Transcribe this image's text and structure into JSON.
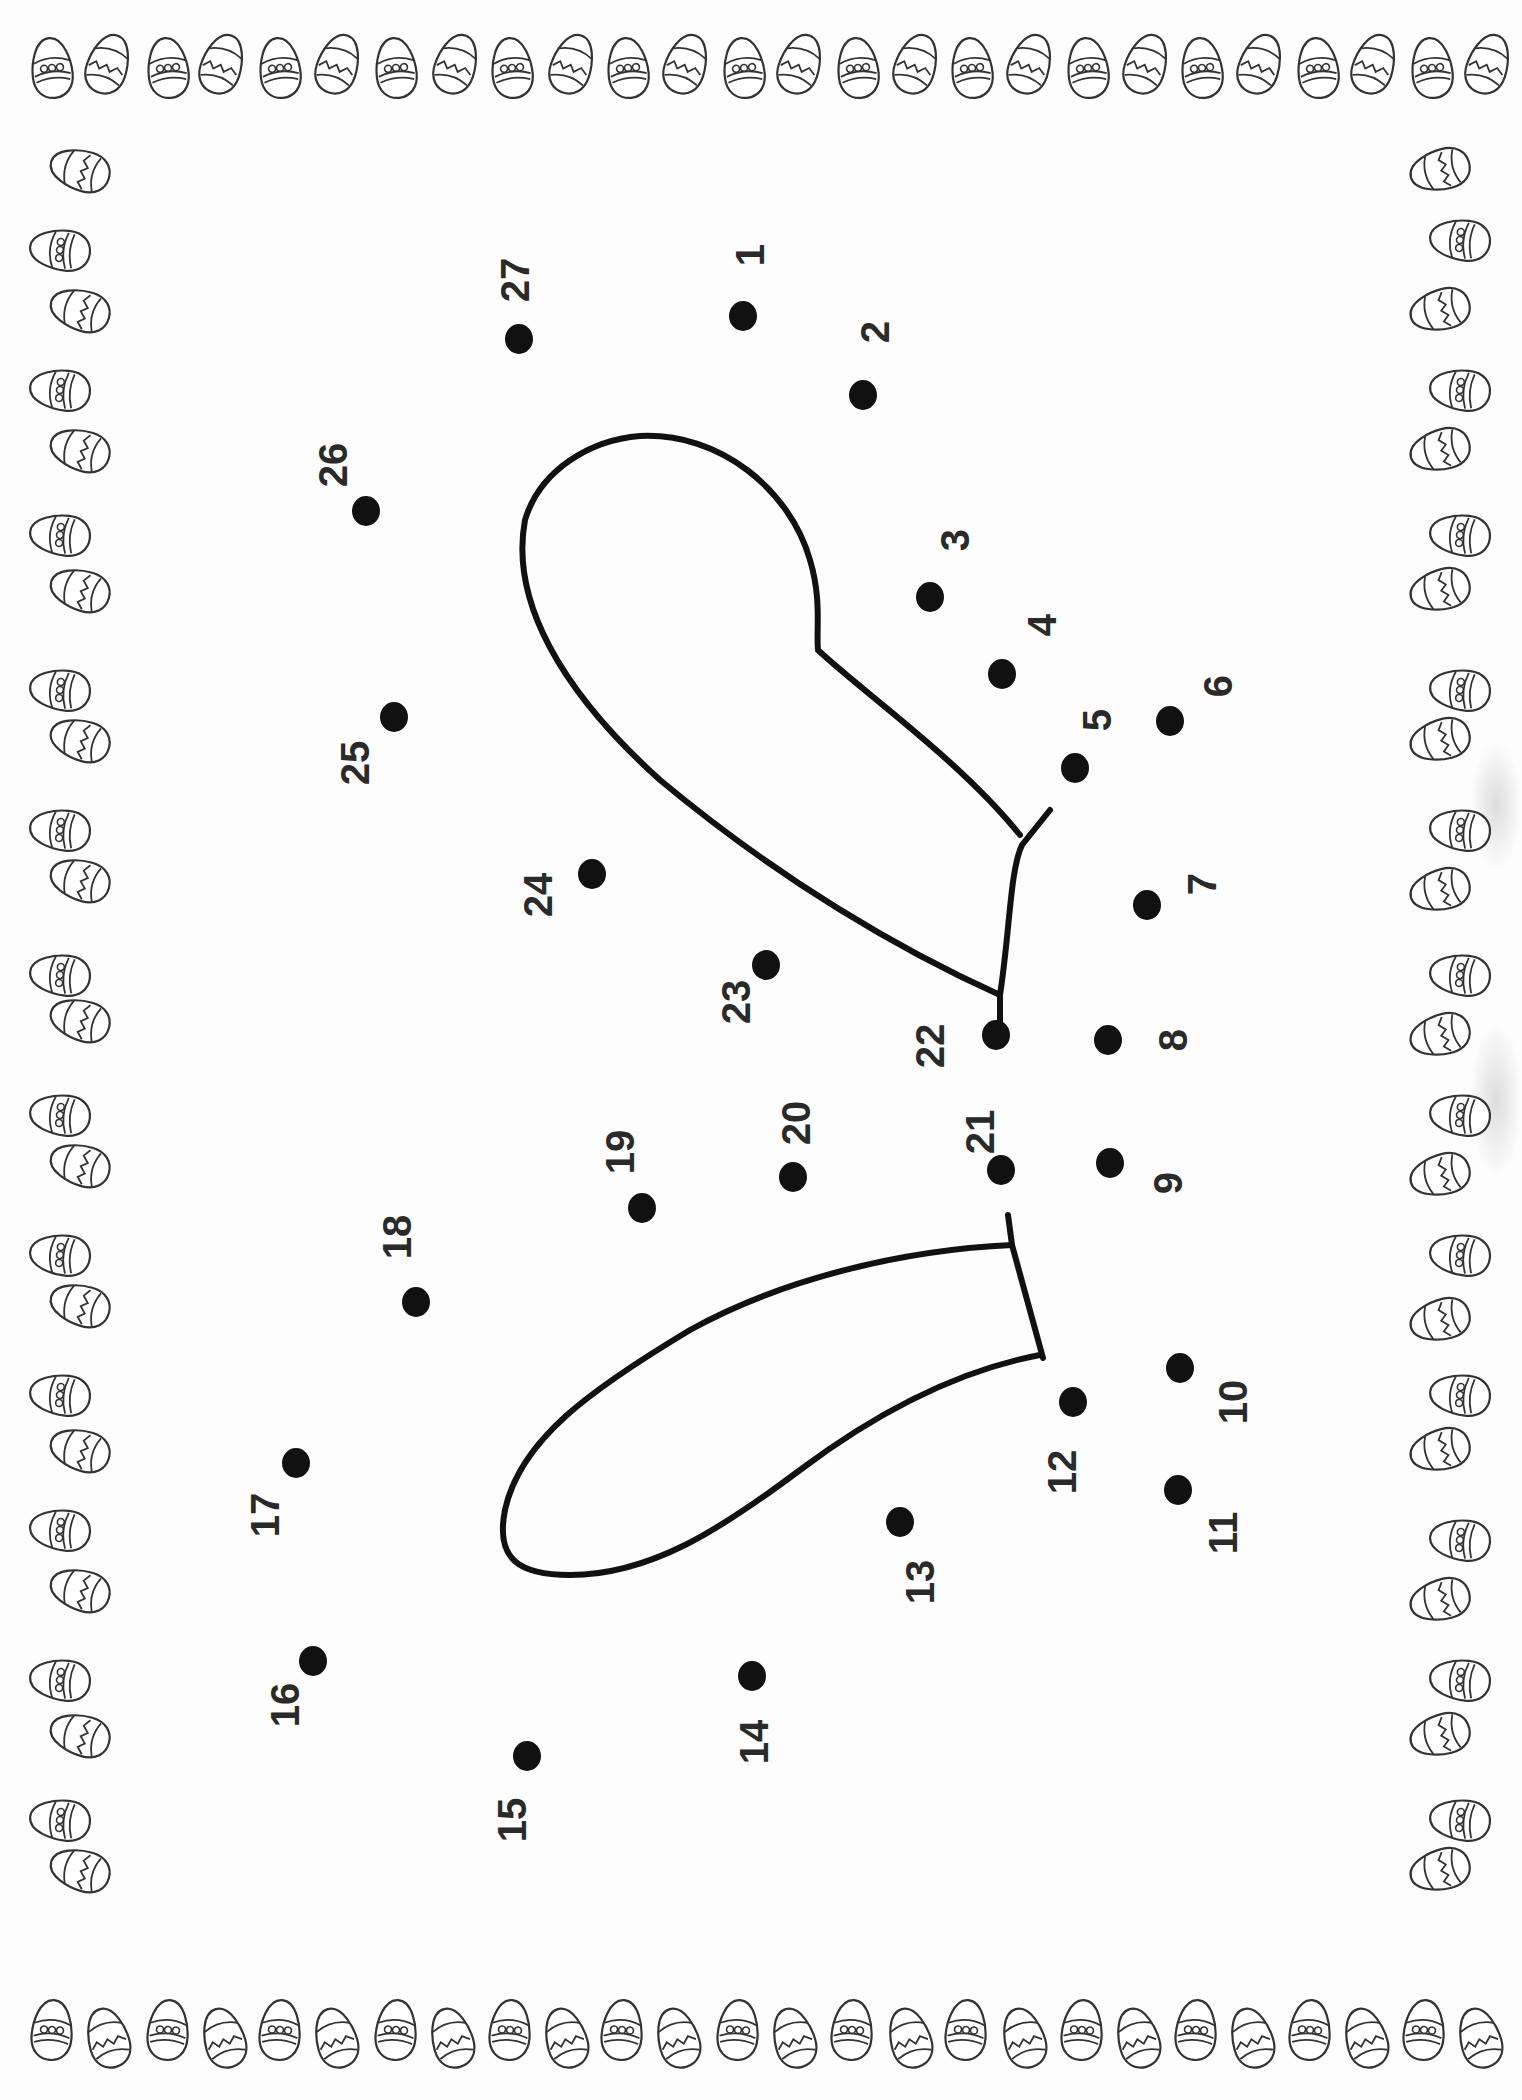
{
  "worksheet": {
    "type": "connect-the-dots",
    "subject": "bunny face with ears",
    "orientation": "rotated 90 degrees",
    "border": "easter-egg border",
    "ink_color": "#111111",
    "paper_color": "#fdfdfd"
  },
  "dots": [
    {
      "n": "1",
      "x": 743,
      "y": 316,
      "lx": 750,
      "ly": 255
    },
    {
      "n": "2",
      "x": 863,
      "y": 395,
      "lx": 875,
      "ly": 332
    },
    {
      "n": "3",
      "x": 930,
      "y": 597,
      "lx": 955,
      "ly": 540
    },
    {
      "n": "4",
      "x": 1002,
      "y": 674,
      "lx": 1042,
      "ly": 625
    },
    {
      "n": "5",
      "x": 1075,
      "y": 768,
      "lx": 1097,
      "ly": 720
    },
    {
      "n": "6",
      "x": 1170,
      "y": 721,
      "lx": 1218,
      "ly": 686
    },
    {
      "n": "7",
      "x": 1147,
      "y": 905,
      "lx": 1202,
      "ly": 884
    },
    {
      "n": "8",
      "x": 1108,
      "y": 1040,
      "lx": 1173,
      "ly": 1040
    },
    {
      "n": "9",
      "x": 1110,
      "y": 1163,
      "lx": 1168,
      "ly": 1183
    },
    {
      "n": "10",
      "x": 1180,
      "y": 1368,
      "lx": 1233,
      "ly": 1402
    },
    {
      "n": "11",
      "x": 1178,
      "y": 1490,
      "lx": 1223,
      "ly": 1533
    },
    {
      "n": "12",
      "x": 1073,
      "y": 1402,
      "lx": 1062,
      "ly": 1472
    },
    {
      "n": "13",
      "x": 900,
      "y": 1522,
      "lx": 920,
      "ly": 1582
    },
    {
      "n": "14",
      "x": 752,
      "y": 1676,
      "lx": 754,
      "ly": 1742
    },
    {
      "n": "15",
      "x": 527,
      "y": 1756,
      "lx": 512,
      "ly": 1820
    },
    {
      "n": "16",
      "x": 313,
      "y": 1661,
      "lx": 285,
      "ly": 1705
    },
    {
      "n": "17",
      "x": 296,
      "y": 1463,
      "lx": 265,
      "ly": 1515
    },
    {
      "n": "18",
      "x": 416,
      "y": 1302,
      "lx": 397,
      "ly": 1237
    },
    {
      "n": "19",
      "x": 642,
      "y": 1208,
      "lx": 620,
      "ly": 1152
    },
    {
      "n": "20",
      "x": 793,
      "y": 1177,
      "lx": 796,
      "ly": 1123
    },
    {
      "n": "21",
      "x": 1001,
      "y": 1170,
      "lx": 980,
      "ly": 1132
    },
    {
      "n": "22",
      "x": 996,
      "y": 1035,
      "lx": 930,
      "ly": 1046
    },
    {
      "n": "23",
      "x": 766,
      "y": 965,
      "lx": 736,
      "ly": 1002
    },
    {
      "n": "24",
      "x": 592,
      "y": 874,
      "lx": 538,
      "ly": 895
    },
    {
      "n": "25",
      "x": 394,
      "y": 717,
      "lx": 355,
      "ly": 763
    },
    {
      "n": "26",
      "x": 366,
      "y": 511,
      "lx": 333,
      "ly": 465
    },
    {
      "n": "27",
      "x": 519,
      "y": 339,
      "lx": 515,
      "ly": 280
    }
  ],
  "border_eggs": {
    "top": {
      "y": 68,
      "xs": [
        52,
        108,
        168,
        222,
        280,
        338,
        396,
        456,
        512,
        572,
        628,
        686,
        744,
        800,
        858,
        916,
        972,
        1030,
        1088,
        1146,
        1202,
        1260,
        1318,
        1374,
        1432,
        1488
      ],
      "pattern_start": "dots"
    },
    "bottom": {
      "y": 2030,
      "xs": [
        52,
        108,
        168,
        224,
        280,
        336,
        396,
        452,
        510,
        566,
        622,
        678,
        738,
        794,
        852,
        910,
        966,
        1024,
        1082,
        1138,
        1196,
        1252,
        1310,
        1366,
        1424,
        1480
      ],
      "pattern_start": "dots"
    },
    "left": {
      "x": 60,
      "ys": [
        170,
        250,
        310,
        390,
        450,
        535,
        590,
        690,
        740,
        830,
        880,
        975,
        1020,
        1115,
        1165,
        1255,
        1305,
        1395,
        1450,
        1530,
        1590,
        1680,
        1735,
        1820,
        1870
      ],
      "pattern_start": "zigzag"
    },
    "right": {
      "x": 1440,
      "ys": [
        170,
        240,
        310,
        390,
        450,
        535,
        590,
        690,
        740,
        830,
        890,
        975,
        1035,
        1115,
        1175,
        1255,
        1320,
        1395,
        1450,
        1540,
        1600,
        1680,
        1735,
        1820,
        1870
      ],
      "pattern_start": "zigzag"
    }
  }
}
